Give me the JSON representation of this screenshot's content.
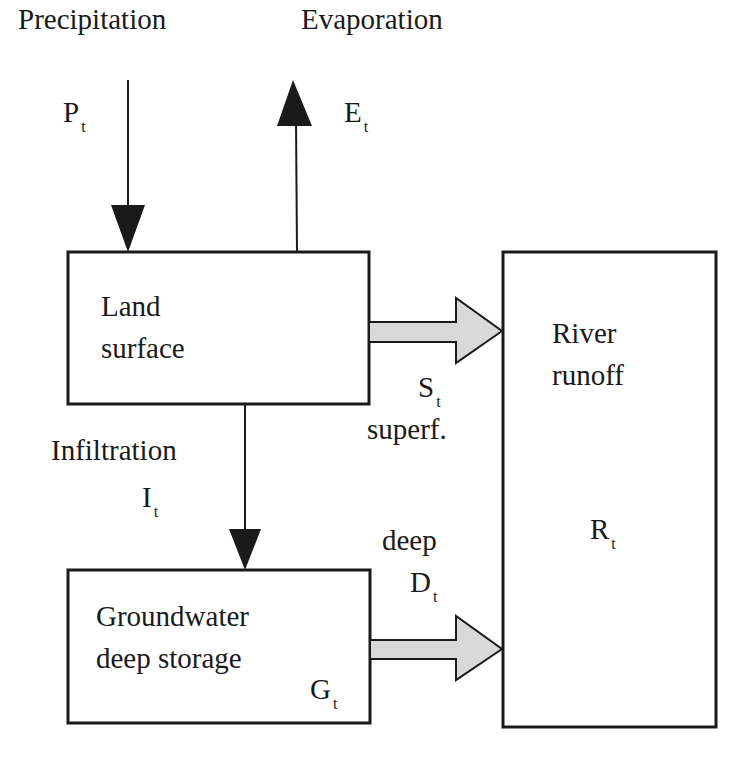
{
  "diagram": {
    "colors": {
      "stroke": "#1a1a1a",
      "flow_arrow_fill": "#d9d9d9",
      "background": "#ffffff"
    },
    "nodes": {
      "land_surface": {
        "line1": "Land",
        "line2": "surface"
      },
      "river_runoff": {
        "line1": "River",
        "line2": "runoff",
        "symbol": "R",
        "subscript": "t"
      },
      "groundwater": {
        "line1": "Groundwater",
        "line2": "deep storage",
        "symbol": "G",
        "subscript": "t"
      }
    },
    "flows": {
      "precipitation": {
        "label": "Precipitation",
        "symbol": "P",
        "subscript": "t"
      },
      "evaporation": {
        "label": "Evaporation",
        "symbol": "E",
        "subscript": "t"
      },
      "superficial": {
        "label": "superf.",
        "symbol": "S",
        "subscript": "t"
      },
      "infiltration": {
        "label": "Infiltration",
        "symbol": "I",
        "subscript": "t"
      },
      "deep": {
        "label": "deep",
        "symbol": "D",
        "subscript": "t"
      }
    }
  }
}
